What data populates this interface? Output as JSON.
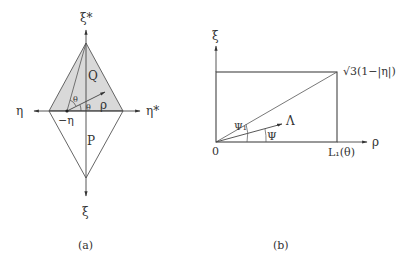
{
  "panel_a": {
    "caption": "(a)",
    "axis_up_label": "ξ*",
    "axis_down_label": "ξ",
    "axis_left_label": "η",
    "axis_right_label": "η*",
    "point_label": "−η",
    "region_upper_label": "Q",
    "region_lower_label": "P",
    "radius_label": "ρ",
    "angle_label_upper": "θ",
    "angle_label_lower": "θ",
    "shade_color": "#d9d9d9"
  },
  "panel_b": {
    "caption": "(b)",
    "axis_x_label": "ρ",
    "axis_y_label": "ξ",
    "origin_label": "0",
    "x_extent_label": "L₁(θ)",
    "y_extent_label": "√3(1−|η|)",
    "direction_label": "Λ",
    "angle_label_diag": "Ψ₁",
    "angle_label_dir": "Ψ"
  }
}
